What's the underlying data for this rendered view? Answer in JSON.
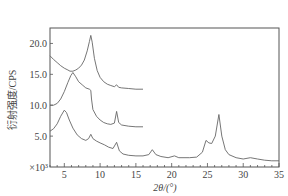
{
  "chart_data": {
    "type": "line",
    "title": "",
    "xlabel": "2θ/(°)",
    "ylabel": "衍射强度/CPS",
    "y_multiplier_label": "×10³",
    "xlim": [
      3,
      35
    ],
    "ylim": [
      0,
      22.5
    ],
    "x_ticks": [
      5,
      10,
      15,
      20,
      25,
      30,
      35
    ],
    "x_tick_labels": [
      "5",
      "10",
      "15",
      "20",
      "25",
      "30",
      "35"
    ],
    "y_ticks": [
      5.0,
      10.0,
      15.0,
      20.0
    ],
    "y_tick_labels": [
      "5.0",
      "10.0",
      "15.0",
      "20.0"
    ],
    "grid": false,
    "legend": null,
    "line_color": "#666666",
    "series": [
      {
        "name": "curve-top",
        "x": [
          3.0,
          3.5,
          4.0,
          4.5,
          5.0,
          5.5,
          5.8,
          6.2,
          6.6,
          7.0,
          7.4,
          7.8,
          8.2,
          8.5,
          8.7,
          8.9,
          9.2,
          9.6,
          10.0,
          10.5,
          11.0,
          11.5,
          12.0,
          12.3,
          12.6,
          13.0,
          14.0,
          15.0,
          16.0
        ],
        "y": [
          18.0,
          17.4,
          16.9,
          16.4,
          16.0,
          15.7,
          15.5,
          15.5,
          15.7,
          16.0,
          16.5,
          17.3,
          18.8,
          20.3,
          21.3,
          20.2,
          17.6,
          15.6,
          14.5,
          13.8,
          13.4,
          13.2,
          13.0,
          13.3,
          12.9,
          12.8,
          12.7,
          12.6,
          12.6
        ]
      },
      {
        "name": "curve-middle",
        "x": [
          3.0,
          3.5,
          4.0,
          4.5,
          5.0,
          5.5,
          5.9,
          6.2,
          6.6,
          7.0,
          7.5,
          8.0,
          8.5,
          8.7,
          8.8,
          9.0,
          9.5,
          10.0,
          10.5,
          11.0,
          11.5,
          12.0,
          12.3,
          12.6,
          13.0,
          14.0,
          15.0,
          16.0
        ],
        "y": [
          10.0,
          10.0,
          10.3,
          11.0,
          12.2,
          13.7,
          14.8,
          15.3,
          14.6,
          13.8,
          13.3,
          12.8,
          12.6,
          12.4,
          11.0,
          9.3,
          8.2,
          7.6,
          7.2,
          7.0,
          6.9,
          7.1,
          9.0,
          7.2,
          6.8,
          6.6,
          6.5,
          6.5
        ]
      },
      {
        "name": "curve-bottom",
        "x": [
          3.0,
          3.5,
          4.0,
          4.5,
          5.0,
          5.3,
          5.7,
          6.2,
          6.8,
          7.4,
          8.0,
          8.4,
          8.7,
          9.0,
          9.5,
          10.0,
          10.6,
          11.2,
          11.8,
          12.3,
          12.7,
          13.2,
          14.0,
          15.0,
          16.0,
          16.8,
          17.3,
          17.8,
          18.5,
          19.5,
          20.4,
          21.0,
          22.5,
          23.5,
          24.3,
          24.8,
          25.2,
          25.6,
          26.1,
          26.6,
          27.0,
          27.5,
          28.0,
          29.0,
          30.0,
          31.0,
          32.0,
          33.0,
          34.0,
          35.0
        ],
        "y": [
          5.8,
          6.2,
          7.0,
          8.2,
          9.2,
          8.8,
          7.6,
          6.3,
          5.2,
          4.6,
          4.3,
          4.6,
          5.3,
          4.6,
          4.2,
          3.9,
          3.6,
          3.2,
          3.0,
          4.0,
          2.6,
          2.1,
          1.9,
          1.8,
          1.8,
          2.0,
          2.8,
          2.0,
          1.7,
          1.5,
          1.8,
          1.5,
          1.5,
          1.6,
          2.4,
          4.3,
          3.9,
          3.8,
          5.0,
          8.5,
          5.0,
          2.8,
          2.0,
          1.5,
          1.3,
          1.5,
          1.3,
          1.1,
          1.0,
          1.0
        ]
      }
    ]
  }
}
